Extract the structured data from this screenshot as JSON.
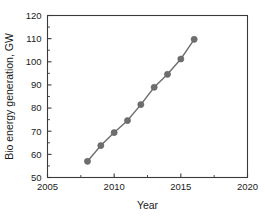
{
  "chart_data": {
    "type": "line",
    "title": "",
    "xlabel": "Year",
    "ylabel": "Bio energy generation, GW",
    "xlim": [
      2005,
      2020
    ],
    "ylim": [
      50,
      120
    ],
    "grid": false,
    "legend": null,
    "x_ticks": [
      2005,
      2010,
      2015,
      2020
    ],
    "x_tick_labels": [
      "2005",
      "2010",
      "2015",
      "2020"
    ],
    "x_minor_ticks": [
      2007.5,
      2012.5,
      2017.5
    ],
    "y_ticks": [
      50,
      60,
      70,
      80,
      90,
      100,
      110,
      120
    ],
    "y_tick_labels": [
      "50",
      "60",
      "70",
      "80",
      "90",
      "100",
      "110",
      "120"
    ],
    "y_minor_ticks": [
      55,
      65,
      75,
      85,
      95,
      105,
      115
    ],
    "series": [
      {
        "name": "Bio energy generation",
        "color": "#6e6e6e",
        "marker": "circle",
        "x": [
          2008,
          2009,
          2010,
          2011,
          2012,
          2013,
          2014,
          2015,
          2016
        ],
        "values": [
          57.0,
          63.8,
          69.4,
          74.6,
          81.5,
          89.0,
          94.6,
          101.2,
          109.7
        ]
      }
    ]
  },
  "figure": {
    "background_color": "#ffffff",
    "axis_color": "#3a3a3a"
  }
}
